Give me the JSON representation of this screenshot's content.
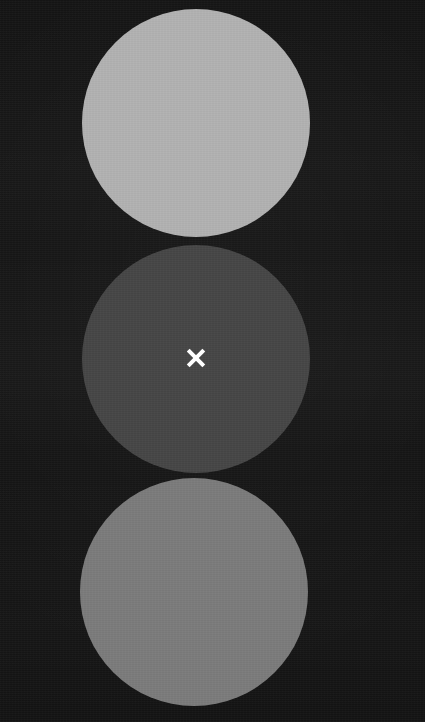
{
  "scene": {
    "name": "three-stacked-circles",
    "width": 425,
    "height": 722,
    "background_color": "#131313",
    "caption": "Three vertically stacked circles of differing gray values on a near-black background, with a white X marker at the center of the middle circle."
  },
  "shapes": [
    {
      "id": "disc-top",
      "label": "Light gray circle",
      "shape": "circle",
      "fill": "#b2b2b2",
      "center_x": 196,
      "center_y": 123,
      "diameter": 228
    },
    {
      "id": "disc-middle",
      "label": "Dark gray circle",
      "shape": "circle",
      "fill": "#464646",
      "center_x": 196,
      "center_y": 359,
      "diameter": 228
    },
    {
      "id": "disc-bottom",
      "label": "Medium gray circle",
      "shape": "circle",
      "fill": "#7c7c7c",
      "center_x": 194,
      "center_y": 592,
      "diameter": 228
    }
  ],
  "marker": {
    "id": "cross-marker",
    "label": "X",
    "glyph": "x-mark-icon",
    "color": "#ffffff",
    "center_x": 196,
    "center_y": 358,
    "size": 18,
    "stroke_width": 4,
    "on_shape": "disc-middle"
  }
}
